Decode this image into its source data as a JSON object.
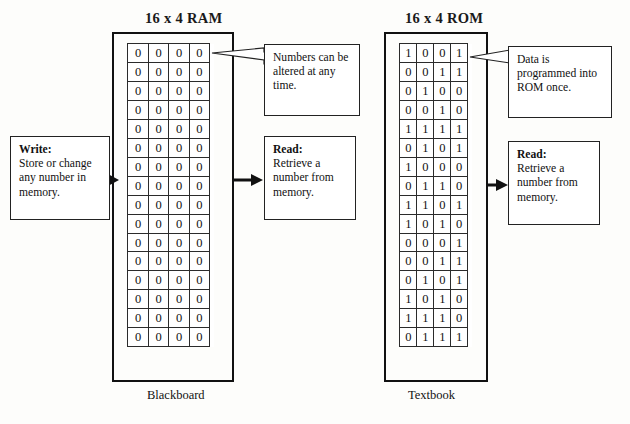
{
  "diagram": {
    "ram": {
      "title": "16 x 4 RAM",
      "caption": "Blackboard",
      "rows": 16,
      "cols": 4,
      "cells": [
        [
          "0",
          "0",
          "0",
          "0"
        ],
        [
          "0",
          "0",
          "0",
          "0"
        ],
        [
          "0",
          "0",
          "0",
          "0"
        ],
        [
          "0",
          "0",
          "0",
          "0"
        ],
        [
          "0",
          "0",
          "0",
          "0"
        ],
        [
          "0",
          "0",
          "0",
          "0"
        ],
        [
          "0",
          "0",
          "0",
          "0"
        ],
        [
          "0",
          "0",
          "0",
          "0"
        ],
        [
          "0",
          "0",
          "0",
          "0"
        ],
        [
          "0",
          "0",
          "0",
          "0"
        ],
        [
          "0",
          "0",
          "0",
          "0"
        ],
        [
          "0",
          "0",
          "0",
          "0"
        ],
        [
          "0",
          "0",
          "0",
          "0"
        ],
        [
          "0",
          "0",
          "0",
          "0"
        ],
        [
          "0",
          "0",
          "0",
          "0"
        ],
        [
          "0",
          "0",
          "0",
          "0"
        ]
      ]
    },
    "rom": {
      "title": "16 x 4 ROM",
      "caption": "Textbook",
      "rows": 16,
      "cols": 4,
      "cells": [
        [
          "1",
          "0",
          "0",
          "1"
        ],
        [
          "0",
          "0",
          "1",
          "1"
        ],
        [
          "0",
          "1",
          "0",
          "0"
        ],
        [
          "0",
          "0",
          "1",
          "0"
        ],
        [
          "1",
          "1",
          "1",
          "1"
        ],
        [
          "0",
          "1",
          "0",
          "1"
        ],
        [
          "1",
          "0",
          "0",
          "0"
        ],
        [
          "0",
          "1",
          "1",
          "0"
        ],
        [
          "1",
          "1",
          "0",
          "1"
        ],
        [
          "1",
          "0",
          "1",
          "0"
        ],
        [
          "0",
          "0",
          "0",
          "1"
        ],
        [
          "0",
          "0",
          "1",
          "1"
        ],
        [
          "0",
          "1",
          "0",
          "1"
        ],
        [
          "1",
          "0",
          "1",
          "0"
        ],
        [
          "1",
          "1",
          "1",
          "0"
        ],
        [
          "0",
          "1",
          "1",
          "1"
        ]
      ]
    },
    "notes": {
      "write": {
        "lead": "Write:",
        "body": "Store or change any number in memory."
      },
      "numbers_altered": {
        "lead": "",
        "body": "Numbers can be altered at any time."
      },
      "read_ram": {
        "lead": "Read:",
        "body": "Retrieve a number from memory."
      },
      "data_programmed": {
        "lead": "",
        "body": "Data is programmed into ROM once."
      },
      "read_rom": {
        "lead": "Read:",
        "body": "Retrieve a number from memory."
      }
    },
    "colors": {
      "ink": "#111111",
      "cell_border": "#2b2b2b",
      "paper": "#fdfdfb"
    }
  }
}
